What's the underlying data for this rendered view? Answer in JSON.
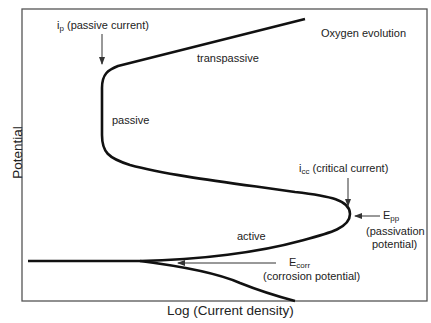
{
  "diagram": {
    "type": "polarization-curve",
    "axes": {
      "xlabel": "Log (Current density)",
      "ylabel": "Potential"
    },
    "regions": {
      "transpassive": "transpassive",
      "passive": "passive",
      "active": "active"
    },
    "annotations": {
      "oxygen": "Oxygen evolution",
      "ip_symbol": "i",
      "ip_sub": "p",
      "ip_text": "(passive current)",
      "icc_symbol": "i",
      "icc_sub": "cc",
      "icc_text": "(critical current)",
      "epp_symbol": "E",
      "epp_sub": "pp",
      "epp_line1": "(passivation",
      "epp_line2": "potential)",
      "ecorr_symbol": "E",
      "ecorr_sub": "corr",
      "ecorr_text": "(corrosion potential)"
    },
    "colors": {
      "curve": "#111111",
      "frame": "#555555",
      "arrow": "#333333",
      "background": "#ffffff"
    }
  }
}
